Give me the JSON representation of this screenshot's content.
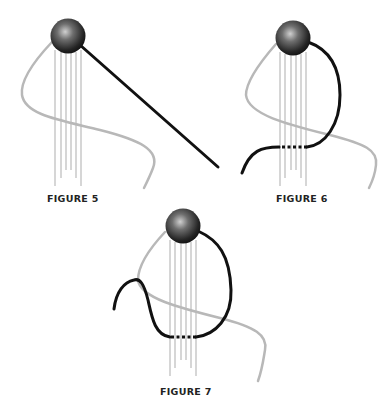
{
  "figures": [
    {
      "id": "figure-5",
      "label": "FIGURE 5"
    },
    {
      "id": "figure-6",
      "label": "FIGURE 6"
    },
    {
      "id": "figure-7",
      "label": "FIGURE 7"
    }
  ],
  "colors": {
    "background": "#ffffff",
    "guide_thread": "#b8b8b8",
    "warp_threads": "#d6d6d6",
    "working_thread": "#111111",
    "bead_dark": "#1a1a1a",
    "bead_light": "#bdbdbd",
    "label_text": "#222222"
  }
}
